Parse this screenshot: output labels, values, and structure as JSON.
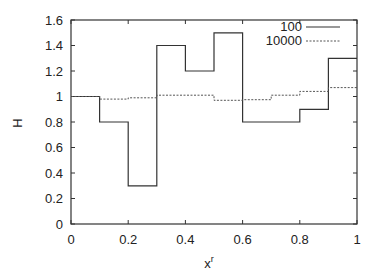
{
  "chart_data": {
    "type": "line",
    "step": true,
    "title": "",
    "xlabel": "x",
    "xlabel_superscript": "r",
    "ylabel": "H",
    "xlim": [
      0,
      1
    ],
    "ylim": [
      0,
      1.6
    ],
    "xticks": [
      "0",
      "0.2",
      "0.4",
      "0.6",
      "0.8",
      "1"
    ],
    "yticks": [
      "0",
      "0.2",
      "0.4",
      "0.6",
      "0.8",
      "1",
      "1.2",
      "1.4",
      "1.6"
    ],
    "grid": false,
    "legend_position": "top-right",
    "bin_edges": [
      0,
      0.1,
      0.2,
      0.3,
      0.4,
      0.5,
      0.6,
      0.7,
      0.8,
      0.9,
      1.0
    ],
    "series": [
      {
        "name": "100",
        "style": "solid",
        "values": [
          1.0,
          0.8,
          0.3,
          1.4,
          1.2,
          1.5,
          0.8,
          0.8,
          0.9,
          1.3
        ]
      },
      {
        "name": "10000",
        "style": "dashed",
        "values": [
          1.0,
          0.98,
          0.99,
          1.01,
          1.01,
          0.97,
          0.975,
          1.01,
          1.04,
          1.07
        ]
      }
    ]
  },
  "legend": {
    "items": [
      {
        "label": "100"
      },
      {
        "label": "10000"
      }
    ]
  },
  "axes": {
    "xlabel": "x",
    "xlabel_sup": "r",
    "ylabel": "H"
  }
}
